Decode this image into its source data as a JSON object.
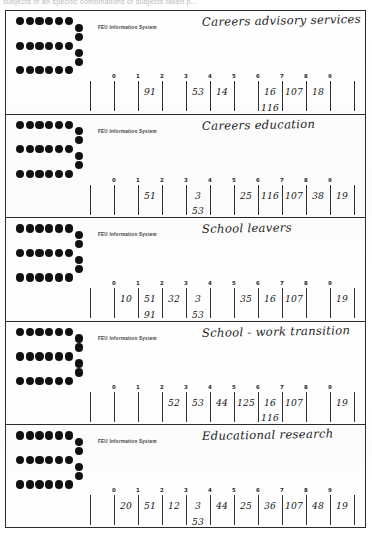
{
  "page": {
    "scan_header_text": "subjects of an specific combinations of subjects taken p...",
    "logo_name": "feu-dotted-e-logo"
  },
  "panels": [
    {
      "printed_label": "FEU Information System",
      "title": "Careers advisory services",
      "ticks": [
        "0",
        "1",
        "2",
        "3",
        "4",
        "5",
        "6",
        "7",
        "8",
        "9"
      ],
      "cells": [
        {
          "index": 0,
          "values": []
        },
        {
          "index": 1,
          "values": [
            "91"
          ]
        },
        {
          "index": 2,
          "values": []
        },
        {
          "index": 3,
          "values": [
            "53"
          ]
        },
        {
          "index": 4,
          "values": [
            "14"
          ]
        },
        {
          "index": 5,
          "values": []
        },
        {
          "index": 6,
          "values": [
            "16",
            "116"
          ]
        },
        {
          "index": 7,
          "values": [
            "107"
          ]
        },
        {
          "index": 8,
          "values": [
            "18"
          ]
        },
        {
          "index": 9,
          "values": []
        }
      ]
    },
    {
      "printed_label": "FEU Information System",
      "title": "Careers education",
      "ticks": [
        "0",
        "1",
        "2",
        "3",
        "4",
        "5",
        "6",
        "7",
        "8",
        "9"
      ],
      "cells": [
        {
          "index": 0,
          "values": []
        },
        {
          "index": 1,
          "values": [
            "51"
          ]
        },
        {
          "index": 2,
          "values": []
        },
        {
          "index": 3,
          "values": [
            "3",
            "53"
          ]
        },
        {
          "index": 4,
          "values": []
        },
        {
          "index": 5,
          "values": [
            "25"
          ]
        },
        {
          "index": 6,
          "values": [
            "116"
          ]
        },
        {
          "index": 7,
          "values": [
            "107"
          ]
        },
        {
          "index": 8,
          "values": [
            "38"
          ]
        },
        {
          "index": 9,
          "values": [
            "19"
          ]
        }
      ]
    },
    {
      "printed_label": "FEU Information System",
      "title": "School leavers",
      "ticks": [
        "0",
        "1",
        "2",
        "3",
        "4",
        "5",
        "6",
        "7",
        "8",
        "9"
      ],
      "cells": [
        {
          "index": 0,
          "values": [
            "10"
          ]
        },
        {
          "index": 1,
          "values": [
            "51",
            "91"
          ]
        },
        {
          "index": 2,
          "values": [
            "32"
          ]
        },
        {
          "index": 3,
          "values": [
            "3",
            "53"
          ]
        },
        {
          "index": 4,
          "values": []
        },
        {
          "index": 5,
          "values": [
            "35"
          ]
        },
        {
          "index": 6,
          "values": [
            "16"
          ]
        },
        {
          "index": 7,
          "values": [
            "107"
          ]
        },
        {
          "index": 8,
          "values": []
        },
        {
          "index": 9,
          "values": [
            "19"
          ]
        }
      ]
    },
    {
      "printed_label": "FEU Information System",
      "title": "School - work transition",
      "ticks": [
        "0",
        "1",
        "2",
        "3",
        "4",
        "5",
        "6",
        "7",
        "8",
        "9"
      ],
      "cells": [
        {
          "index": 0,
          "values": []
        },
        {
          "index": 1,
          "values": []
        },
        {
          "index": 2,
          "values": [
            "52"
          ]
        },
        {
          "index": 3,
          "values": [
            "53"
          ]
        },
        {
          "index": 4,
          "values": [
            "44"
          ]
        },
        {
          "index": 5,
          "values": [
            "125"
          ]
        },
        {
          "index": 6,
          "values": [
            "16",
            "116"
          ]
        },
        {
          "index": 7,
          "values": [
            "107"
          ]
        },
        {
          "index": 8,
          "values": []
        },
        {
          "index": 9,
          "values": [
            "19"
          ]
        }
      ]
    },
    {
      "printed_label": "FEU Information System",
      "title": "Educational research",
      "ticks": [
        "0",
        "1",
        "2",
        "3",
        "4",
        "5",
        "6",
        "7",
        "8",
        "9"
      ],
      "cells": [
        {
          "index": 0,
          "values": [
            "20"
          ]
        },
        {
          "index": 1,
          "values": [
            "51"
          ]
        },
        {
          "index": 2,
          "values": [
            "12"
          ]
        },
        {
          "index": 3,
          "values": [
            "3",
            "53"
          ]
        },
        {
          "index": 4,
          "values": [
            "44"
          ]
        },
        {
          "index": 5,
          "values": [
            "25"
          ]
        },
        {
          "index": 6,
          "values": [
            "36"
          ]
        },
        {
          "index": 7,
          "values": [
            "107"
          ]
        },
        {
          "index": 8,
          "values": [
            "48"
          ]
        },
        {
          "index": 9,
          "values": [
            "19"
          ]
        }
      ]
    }
  ]
}
